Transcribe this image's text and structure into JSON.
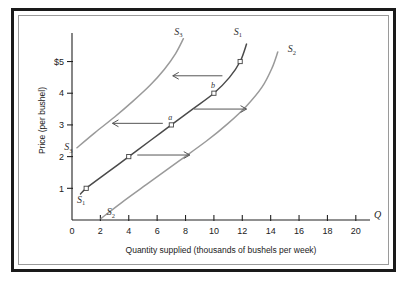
{
  "figure": {
    "background": "#ffffff",
    "frame_color": "#1a1a1a",
    "inner_frame_color": "#9a9a9a"
  },
  "chart_data": {
    "type": "line",
    "title": "",
    "xlabel": "Quantity supplied (thousands of bushels per week)",
    "ylabel": "Price (per bushel)",
    "xlim": [
      0,
      21
    ],
    "ylim": [
      0,
      5.9
    ],
    "grid": false,
    "legend": "none",
    "x_axis_letter": "Q",
    "xticks": [
      0,
      2,
      4,
      6,
      8,
      10,
      12,
      14,
      16,
      18,
      20
    ],
    "xtick_labels": [
      "0",
      "2",
      "4",
      "6",
      "8",
      "10",
      "12",
      "14",
      "16",
      "18",
      "20"
    ],
    "yticks": [
      1,
      2,
      3,
      4,
      5
    ],
    "ytick_labels": [
      "1",
      "2",
      "3",
      "4",
      "$5"
    ],
    "series": [
      {
        "name": "S1",
        "label": "S",
        "subscript": "1",
        "color": "#4a4a4a",
        "width": 1.5,
        "points": [
          {
            "x": 0.6,
            "y": 0.82
          },
          {
            "x": 1.0,
            "y": 1.0
          },
          {
            "x": 2.5,
            "y": 1.5
          },
          {
            "x": 4.0,
            "y": 2.0
          },
          {
            "x": 5.5,
            "y": 2.5
          },
          {
            "x": 7.0,
            "y": 3.0
          },
          {
            "x": 8.5,
            "y": 3.5
          },
          {
            "x": 10.0,
            "y": 4.0
          },
          {
            "x": 11.1,
            "y": 4.5
          },
          {
            "x": 11.85,
            "y": 5.0
          },
          {
            "x": 12.3,
            "y": 5.55
          }
        ]
      },
      {
        "name": "S2",
        "label": "S",
        "subscript": "2",
        "color": "#9a9a9a",
        "width": 1.5,
        "points": [
          {
            "x": 2.05,
            "y": 0.05
          },
          {
            "x": 3.5,
            "y": 0.55
          },
          {
            "x": 5.5,
            "y": 1.2
          },
          {
            "x": 7.5,
            "y": 1.85
          },
          {
            "x": 9.5,
            "y": 2.5
          },
          {
            "x": 11.0,
            "y": 3.05
          },
          {
            "x": 12.3,
            "y": 3.6
          },
          {
            "x": 13.4,
            "y": 4.2
          },
          {
            "x": 14.1,
            "y": 4.8
          },
          {
            "x": 14.5,
            "y": 5.3
          }
        ]
      },
      {
        "name": "S3",
        "label": "S",
        "subscript": "3",
        "color": "#9a9a9a",
        "width": 1.5,
        "points": [
          {
            "x": 0.35,
            "y": 2.28
          },
          {
            "x": 1.6,
            "y": 2.75
          },
          {
            "x": 3.0,
            "y": 3.25
          },
          {
            "x": 4.3,
            "y": 3.75
          },
          {
            "x": 5.5,
            "y": 4.25
          },
          {
            "x": 6.5,
            "y": 4.75
          },
          {
            "x": 7.3,
            "y": 5.25
          },
          {
            "x": 7.85,
            "y": 5.72
          }
        ]
      }
    ],
    "markers": [
      {
        "x": 1,
        "y": 1,
        "label": "",
        "shape": "open-square"
      },
      {
        "x": 4,
        "y": 2,
        "label": "",
        "shape": "open-square"
      },
      {
        "x": 7,
        "y": 3,
        "label": "a",
        "shape": "open-square"
      },
      {
        "x": 10,
        "y": 4,
        "label": "b",
        "shape": "open-square"
      },
      {
        "x": 11.85,
        "y": 5,
        "label": "",
        "shape": "open-square"
      }
    ],
    "annotations": [
      {
        "name": "shift-right-low",
        "direction": "right",
        "x_start": 4.6,
        "x_end": 8.3,
        "y": 2.05
      },
      {
        "name": "shift-left-mid",
        "direction": "left",
        "x_start": 6.4,
        "x_end": 2.85,
        "y": 3.05
      },
      {
        "name": "shift-right-mid",
        "direction": "right",
        "x_start": 8.6,
        "x_end": 12.3,
        "y": 3.5
      },
      {
        "name": "shift-left-high",
        "direction": "left",
        "x_start": 10.6,
        "x_end": 7.1,
        "y": 4.55
      }
    ],
    "curve_labels": [
      {
        "name": "S3-top",
        "label": "S",
        "subscript": "3",
        "x": 7.2,
        "y": 5.85
      },
      {
        "name": "S1-top",
        "label": "S",
        "subscript": "1",
        "x": 11.4,
        "y": 5.85
      },
      {
        "name": "S2-top",
        "label": "S",
        "subscript": "2",
        "x": 15.2,
        "y": 5.3
      },
      {
        "name": "S3-left",
        "label": "S",
        "subscript": "3",
        "x": -0.55,
        "y": 2.2
      },
      {
        "name": "S1-origin",
        "label": "S",
        "subscript": "1",
        "x": 0.35,
        "y": 0.55
      },
      {
        "name": "S2-bottom",
        "label": "S",
        "subscript": "2",
        "x": 2.45,
        "y": 0.15
      }
    ]
  }
}
